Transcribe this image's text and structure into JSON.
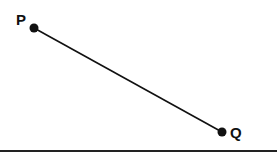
{
  "diagram": {
    "type": "line-segment",
    "points": [
      {
        "label": "P",
        "x": 34,
        "y": 28
      },
      {
        "label": "Q",
        "x": 222,
        "y": 132
      }
    ],
    "segment": {
      "from": "P",
      "to": "Q",
      "color": "#111111"
    },
    "baseline": {
      "y": 151,
      "color": "#222222"
    }
  }
}
